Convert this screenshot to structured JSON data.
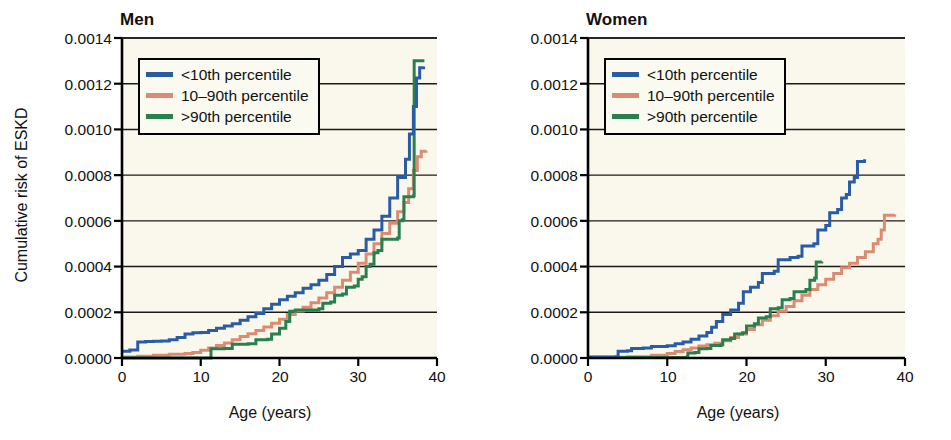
{
  "figure": {
    "background": "#ffffff",
    "plot_background": "#faf8ec",
    "axis_color": "#000000",
    "gridline_color": "#1a1a1a"
  },
  "colors": {
    "blue": "#2a5ca6",
    "salmon": "#dd8a72",
    "green": "#2a7f4f"
  },
  "legend": {
    "items": [
      {
        "label": "<10th percentile",
        "color_key": "blue"
      },
      {
        "label": "10–90th percentile",
        "color_key": "salmon"
      },
      {
        "label": ">90th percentile",
        "color_key": "green"
      }
    ]
  },
  "axes": {
    "ylabel": "Cumulative risk of ESKD",
    "xlabel": "Age (years)",
    "yticks": [
      "0.0000",
      "0.0002",
      "0.0004",
      "0.0006",
      "0.0008",
      "0.0010",
      "0.0012",
      "0.0014"
    ],
    "xticks": [
      "0",
      "10",
      "20",
      "30",
      "40"
    ],
    "ylim": [
      0,
      0.0014
    ],
    "xlim": [
      0,
      40
    ]
  },
  "panels": [
    {
      "title": "Men"
    },
    {
      "title": "Women"
    }
  ],
  "chart_data": {
    "type": "line",
    "xlabel": "Age (years)",
    "ylabel": "Cumulative risk of ESKD",
    "xlim": [
      0,
      40
    ],
    "ylim": [
      0,
      0.0014
    ],
    "xticks": [
      0,
      10,
      20,
      30,
      40
    ],
    "yticks": [
      0.0,
      0.0002,
      0.0004,
      0.0006,
      0.0008,
      0.001,
      0.0012,
      0.0014
    ],
    "grid": "horizontal",
    "legend_position": "upper-left-inside",
    "step_style": "post",
    "panels": [
      {
        "title": "Men",
        "series": [
          {
            "name": "<10th percentile",
            "color": "#2a5ca6",
            "points": [
              [
                0.0,
                3e-05
              ],
              [
                1.0,
                3.5e-05
              ],
              [
                2.0,
                7e-05
              ],
              [
                3.0,
                7.2e-05
              ],
              [
                4.0,
                7.3e-05
              ],
              [
                5.0,
                7.4e-05
              ],
              [
                6.0,
                8e-05
              ],
              [
                7.0,
                9e-05
              ],
              [
                8.0,
                0.000105
              ],
              [
                9.0,
                0.00011
              ],
              [
                10.0,
                0.000112
              ],
              [
                11.0,
                0.00012
              ],
              [
                12.0,
                0.00013
              ],
              [
                13.0,
                0.00014
              ],
              [
                14.0,
                0.00015
              ],
              [
                15.0,
                0.000165
              ],
              [
                16.0,
                0.00018
              ],
              [
                17.0,
                0.000195
              ],
              [
                18.0,
                0.000215
              ],
              [
                19.0,
                0.000235
              ],
              [
                20.0,
                0.000255
              ],
              [
                21.0,
                0.00027
              ],
              [
                22.0,
                0.000285
              ],
              [
                23.0,
                0.000305
              ],
              [
                24.0,
                0.00032
              ],
              [
                25.0,
                0.00034
              ],
              [
                26.0,
                0.000365
              ],
              [
                27.0,
                0.0004
              ],
              [
                28.0,
                0.00044
              ],
              [
                29.0,
                0.000455
              ],
              [
                30.0,
                0.00047
              ],
              [
                31.0,
                0.00052
              ],
              [
                32.0,
                0.00056
              ],
              [
                33.0,
                0.00062
              ],
              [
                34.0,
                0.0007
              ],
              [
                35.0,
                0.00079
              ],
              [
                36.0,
                0.00087
              ],
              [
                36.5,
                0.00098
              ],
              [
                37.0,
                0.0011
              ],
              [
                37.4,
                0.001225
              ],
              [
                37.8,
                0.00127
              ],
              [
                38.3,
                0.001275
              ]
            ]
          },
          {
            "name": "10–90th percentile",
            "color": "#dd8a72",
            "points": [
              [
                0.0,
                4e-06
              ],
              [
                2.0,
                8e-06
              ],
              [
                4.0,
                1.2e-05
              ],
              [
                6.0,
                1.6e-05
              ],
              [
                8.0,
                2e-05
              ],
              [
                9.0,
                2.4e-05
              ],
              [
                10.0,
                3.4e-05
              ],
              [
                11.0,
                4.4e-05
              ],
              [
                12.0,
                5.5e-05
              ],
              [
                13.0,
                6.6e-05
              ],
              [
                14.0,
                8e-05
              ],
              [
                15.0,
                9.4e-05
              ],
              [
                16.0,
                0.000106
              ],
              [
                17.0,
                0.00012
              ],
              [
                18.0,
                0.000136
              ],
              [
                19.0,
                0.000152
              ],
              [
                20.0,
                0.00017
              ],
              [
                21.0,
                0.00019
              ],
              [
                22.0,
                0.000206
              ],
              [
                23.0,
                0.000222
              ],
              [
                24.0,
                0.000242
              ],
              [
                25.0,
                0.000262
              ],
              [
                26.0,
                0.000285
              ],
              [
                27.0,
                0.00031
              ],
              [
                28.0,
                0.00034
              ],
              [
                29.0,
                0.000375
              ],
              [
                30.0,
                0.000415
              ],
              [
                31.0,
                0.000455
              ],
              [
                32.0,
                0.0005
              ],
              [
                33.0,
                0.000545
              ],
              [
                34.0,
                0.00059
              ],
              [
                35.0,
                0.00064
              ],
              [
                35.8,
                0.00068
              ],
              [
                36.4,
                0.00074
              ],
              [
                37.0,
                0.00082
              ],
              [
                37.5,
                0.00088
              ],
              [
                38.0,
                0.000905
              ],
              [
                38.6,
                0.000908
              ]
            ]
          },
          {
            "name": ">90th percentile",
            "color": "#2a7f4f",
            "points": [
              [
                0.0,
                0.0
              ],
              [
                11.2,
                0.0
              ],
              [
                11.3,
                4e-05
              ],
              [
                13.0,
                4.2e-05
              ],
              [
                14.0,
                6e-05
              ],
              [
                16.0,
                6.2e-05
              ],
              [
                17.0,
                8e-05
              ],
              [
                18.5,
                8.2e-05
              ],
              [
                19.0,
                0.000105
              ],
              [
                20.0,
                0.00013
              ],
              [
                20.8,
                0.00016
              ],
              [
                21.3,
                0.000205
              ],
              [
                22.0,
                0.00021
              ],
              [
                25.0,
                0.000215
              ],
              [
                25.5,
                0.00024
              ],
              [
                26.5,
                0.000245
              ],
              [
                27.0,
                0.000275
              ],
              [
                28.0,
                0.00028
              ],
              [
                28.5,
                0.00031
              ],
              [
                29.5,
                0.000315
              ],
              [
                30.0,
                0.000345
              ],
              [
                30.5,
                0.000355
              ],
              [
                31.0,
                0.0004
              ],
              [
                31.5,
                0.00041
              ],
              [
                32.0,
                0.00046
              ],
              [
                32.5,
                0.00047
              ],
              [
                33.0,
                0.00052
              ],
              [
                35.0,
                0.000525
              ],
              [
                35.2,
                0.0006
              ],
              [
                35.6,
                0.000605
              ],
              [
                35.8,
                0.000705
              ],
              [
                37.0,
                0.00071
              ],
              [
                37.1,
                0.0013
              ],
              [
                38.4,
                0.0013
              ]
            ]
          }
        ]
      },
      {
        "title": "Women",
        "series": [
          {
            "name": "<10th percentile",
            "color": "#2a5ca6",
            "points": [
              [
                0.0,
                4e-06
              ],
              [
                3.5,
                6e-06
              ],
              [
                3.8,
                3e-05
              ],
              [
                5.0,
                3.2e-05
              ],
              [
                5.5,
                4.2e-05
              ],
              [
                7.0,
                4.4e-05
              ],
              [
                8.0,
                5e-05
              ],
              [
                10.0,
                5.4e-05
              ],
              [
                11.0,
                6.2e-05
              ],
              [
                12.0,
                7e-05
              ],
              [
                13.0,
                8.2e-05
              ],
              [
                14.0,
                9.6e-05
              ],
              [
                15.0,
                0.000112
              ],
              [
                15.6,
                0.000135
              ],
              [
                16.2,
                0.00016
              ],
              [
                17.0,
                0.00019
              ],
              [
                18.0,
                0.00021
              ],
              [
                19.0,
                0.00024
              ],
              [
                19.6,
                0.00029
              ],
              [
                20.5,
                0.00031
              ],
              [
                21.5,
                0.00033
              ],
              [
                22.0,
                0.00037
              ],
              [
                23.5,
                0.00038
              ],
              [
                24.0,
                0.00043
              ],
              [
                25.5,
                0.00044
              ],
              [
                26.5,
                0.000445
              ],
              [
                27.0,
                0.00049
              ],
              [
                28.5,
                0.0005
              ],
              [
                29.0,
                0.00056
              ],
              [
                30.0,
                0.00058
              ],
              [
                30.5,
                0.000635
              ],
              [
                31.5,
                0.00065
              ],
              [
                32.0,
                0.0007
              ],
              [
                32.6,
                0.000715
              ],
              [
                33.0,
                0.00077
              ],
              [
                33.6,
                0.00079
              ],
              [
                34.0,
                0.00086
              ],
              [
                34.9,
                0.00087
              ]
            ]
          },
          {
            "name": "10–90th percentile",
            "color": "#dd8a72",
            "points": [
              [
                0.0,
                3e-06
              ],
              [
                5.0,
                6e-06
              ],
              [
                8.0,
                1.2e-05
              ],
              [
                10.0,
                2e-05
              ],
              [
                11.0,
                2.8e-05
              ],
              [
                12.0,
                3.6e-05
              ],
              [
                13.0,
                4.4e-05
              ],
              [
                14.0,
                5.2e-05
              ],
              [
                15.0,
                5.8e-05
              ],
              [
                16.0,
                6.4e-05
              ],
              [
                17.0,
                7.5e-05
              ],
              [
                18.0,
                9e-05
              ],
              [
                19.0,
                0.000105
              ],
              [
                20.0,
                0.000125
              ],
              [
                21.0,
                0.000145
              ],
              [
                22.0,
                0.000165
              ],
              [
                23.0,
                0.000185
              ],
              [
                24.0,
                0.000205
              ],
              [
                25.0,
                0.000225
              ],
              [
                26.0,
                0.00025
              ],
              [
                27.0,
                0.000275
              ],
              [
                28.0,
                0.0003
              ],
              [
                29.0,
                0.00032
              ],
              [
                30.0,
                0.000345
              ],
              [
                31.0,
                0.00037
              ],
              [
                32.0,
                0.000395
              ],
              [
                33.0,
                0.000415
              ],
              [
                34.0,
                0.00044
              ],
              [
                35.0,
                0.000465
              ],
              [
                36.0,
                0.0005
              ],
              [
                36.6,
                0.00052
              ],
              [
                37.0,
                0.00056
              ],
              [
                37.4,
                0.000625
              ],
              [
                38.7,
                0.000628
              ]
            ]
          },
          {
            "name": ">90th percentile",
            "color": "#2a7f4f",
            "points": [
              [
                0.0,
                2e-06
              ],
              [
                12.5,
                4e-06
              ],
              [
                12.6,
                2.2e-05
              ],
              [
                13.5,
                2.4e-05
              ],
              [
                14.0,
                4e-05
              ],
              [
                15.0,
                4.2e-05
              ],
              [
                15.5,
                5.5e-05
              ],
              [
                16.8,
                5.8e-05
              ],
              [
                17.0,
                8e-05
              ],
              [
                18.0,
                8.5e-05
              ],
              [
                18.5,
                0.000105
              ],
              [
                19.5,
                0.00011
              ],
              [
                20.0,
                0.00014
              ],
              [
                21.0,
                0.00015
              ],
              [
                21.5,
                0.000175
              ],
              [
                22.5,
                0.00018
              ],
              [
                23.0,
                0.000215
              ],
              [
                24.0,
                0.00022
              ],
              [
                24.5,
                0.000255
              ],
              [
                25.5,
                0.00026
              ],
              [
                26.0,
                0.00029
              ],
              [
                27.5,
                0.0003
              ],
              [
                28.0,
                0.00034
              ],
              [
                28.6,
                0.00035
              ],
              [
                28.8,
                0.00042
              ],
              [
                29.5,
                0.000422
              ]
            ]
          }
        ]
      }
    ]
  }
}
